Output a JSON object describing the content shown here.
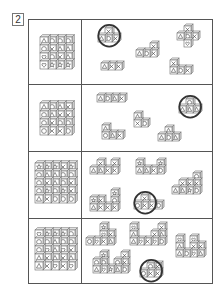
{
  "question": {
    "number": "2"
  },
  "colors": {
    "line": "#555555",
    "cube_stroke": "#666666",
    "cube_top": "#e8e8e8",
    "cube_side": "#d0d0d0",
    "circle": "#333333"
  },
  "symbols_legend": {
    "o": "circle",
    "x": "cross",
    "t": "triangle",
    "h": "heart",
    "s": "star"
  },
  "rows": [
    {
      "id": 1,
      "block": {
        "x": 40,
        "y": 37,
        "cell": 8,
        "grid": [
          [
            "t",
            "o",
            "o",
            "o"
          ],
          [
            "o",
            "x",
            "t",
            "t"
          ],
          [
            "h",
            "o",
            "x",
            "t"
          ],
          [
            "h",
            "s",
            "s",
            "s"
          ]
        ]
      },
      "pieces": [
        {
          "circled": true,
          "cells": [
            {
              "c": 1,
              "r": 0,
              "s": "x"
            },
            {
              "c": 0,
              "r": 1,
              "s": "t"
            },
            {
              "c": 1,
              "r": 1,
              "s": "o"
            },
            {
              "c": 2,
              "r": 1,
              "s": "x"
            }
          ],
          "x": 98,
          "y": 28,
          "cell": 7
        },
        {
          "circled": false,
          "cells": [
            {
              "c": 2,
              "r": 0,
              "s": "x"
            },
            {
              "c": 0,
              "r": 1,
              "s": "t"
            },
            {
              "c": 1,
              "r": 1,
              "s": "o"
            },
            {
              "c": 2,
              "r": 1,
              "s": "x"
            }
          ],
          "x": 136,
          "y": 43,
          "cell": 7
        },
        {
          "circled": false,
          "cells": [
            {
              "c": 1,
              "r": 0,
              "s": "x"
            },
            {
              "c": 0,
              "r": 1,
              "s": "t"
            },
            {
              "c": 1,
              "r": 1,
              "s": "o"
            },
            {
              "c": 2,
              "r": 1,
              "s": "x"
            },
            {
              "c": 1,
              "r": 2,
              "s": "h"
            }
          ],
          "x": 177,
          "y": 26,
          "cell": 7
        },
        {
          "circled": false,
          "cells": [
            {
              "c": 0,
              "r": 0,
              "s": "t"
            },
            {
              "c": 1,
              "r": 0,
              "s": "x"
            },
            {
              "c": 2,
              "r": 0,
              "s": "x"
            }
          ],
          "x": 101,
          "y": 63,
          "cell": 7
        },
        {
          "circled": false,
          "cells": [
            {
              "c": 0,
              "r": 0,
              "s": "x"
            },
            {
              "c": 0,
              "r": 1,
              "s": "t"
            },
            {
              "c": 1,
              "r": 1,
              "s": "o"
            },
            {
              "c": 2,
              "r": 1,
              "s": "x"
            }
          ],
          "x": 170,
          "y": 60,
          "cell": 7
        }
      ]
    },
    {
      "id": 2,
      "block": {
        "x": 40,
        "y": 103,
        "cell": 8,
        "grid": [
          [
            "t",
            "o",
            "t",
            "x"
          ],
          [
            "o",
            "t",
            "x",
            "x"
          ],
          [
            "o",
            "x",
            "o",
            "o"
          ],
          [
            "o",
            "x",
            "x",
            "o"
          ]
        ]
      },
      "pieces": [
        {
          "circled": false,
          "cells": [
            {
              "c": 0,
              "r": 0,
              "s": "t"
            },
            {
              "c": 1,
              "r": 0,
              "s": "o"
            },
            {
              "c": 2,
              "r": 0,
              "s": "t"
            },
            {
              "c": 3,
              "r": 0,
              "s": "x"
            }
          ],
          "x": 97,
          "y": 95,
          "cell": 7
        },
        {
          "circled": true,
          "cells": [
            {
              "c": 1,
              "r": 0,
              "s": "o"
            },
            {
              "c": 0,
              "r": 1,
              "s": "t"
            },
            {
              "c": 1,
              "r": 1,
              "s": "t"
            },
            {
              "c": 2,
              "r": 1,
              "s": "t"
            }
          ],
          "x": 179,
          "y": 99,
          "cell": 7
        },
        {
          "circled": false,
          "cells": [
            {
              "c": 0,
              "r": 0,
              "s": "t"
            },
            {
              "c": 0,
              "r": 1,
              "s": "x"
            },
            {
              "c": 1,
              "r": 1,
              "s": "o"
            }
          ],
          "x": 134,
          "y": 113,
          "cell": 7
        },
        {
          "circled": false,
          "cells": [
            {
              "c": 0,
              "r": 0,
              "s": "t"
            },
            {
              "c": 0,
              "r": 1,
              "s": "o"
            },
            {
              "c": 1,
              "r": 1,
              "s": "t"
            },
            {
              "c": 2,
              "r": 1,
              "s": "x"
            }
          ],
          "x": 102,
          "y": 125,
          "cell": 7
        },
        {
          "circled": false,
          "cells": [
            {
              "c": 1,
              "r": 0,
              "s": "t"
            },
            {
              "c": 0,
              "r": 1,
              "s": "t"
            },
            {
              "c": 1,
              "r": 1,
              "s": "o"
            },
            {
              "c": 2,
              "r": 1,
              "s": "t"
            }
          ],
          "x": 158,
          "y": 127,
          "cell": 7
        }
      ]
    },
    {
      "id": 3,
      "block": {
        "x": 35,
        "y": 163,
        "cell": 8,
        "grid": [
          [
            "s",
            "s",
            "s",
            "x",
            "s"
          ],
          [
            "o",
            "t",
            "t",
            "o",
            "o"
          ],
          [
            "o",
            "x",
            "t",
            "o",
            "x"
          ],
          [
            "o",
            "s",
            "o",
            "s",
            "x"
          ],
          [
            "t",
            "x",
            "o",
            "o",
            "o"
          ]
        ]
      },
      "pieces": [
        {
          "circled": false,
          "cells": [
            {
              "c": 1,
              "r": 0,
              "s": "x"
            },
            {
              "c": 3,
              "r": 0,
              "s": "x"
            },
            {
              "c": 0,
              "r": 1,
              "s": "t"
            },
            {
              "c": 1,
              "r": 1,
              "s": "t"
            },
            {
              "c": 2,
              "r": 1,
              "s": "x"
            },
            {
              "c": 3,
              "r": 1,
              "s": "x"
            }
          ],
          "x": 90,
          "y": 160,
          "cell": 7
        },
        {
          "circled": false,
          "cells": [
            {
              "c": 0,
              "r": 0,
              "s": "s"
            },
            {
              "c": 3,
              "r": 0,
              "s": "s"
            },
            {
              "c": 0,
              "r": 1,
              "s": "t"
            },
            {
              "c": 1,
              "r": 1,
              "s": "t"
            },
            {
              "c": 2,
              "r": 1,
              "s": "x"
            },
            {
              "c": 3,
              "r": 1,
              "s": "o"
            }
          ],
          "x": 136,
          "y": 160,
          "cell": 7
        },
        {
          "circled": false,
          "cells": [
            {
              "c": 3,
              "r": 0,
              "s": "o"
            },
            {
              "c": 1,
              "r": 1,
              "s": "x"
            },
            {
              "c": 2,
              "r": 1,
              "s": "x"
            },
            {
              "c": 3,
              "r": 1,
              "s": "x"
            },
            {
              "c": 0,
              "r": 2,
              "s": "t"
            },
            {
              "c": 1,
              "r": 2,
              "s": "t"
            },
            {
              "c": 2,
              "r": 2,
              "s": "s"
            },
            {
              "c": 3,
              "r": 2,
              "s": "o"
            }
          ],
          "x": 172,
          "y": 173,
          "cell": 7
        },
        {
          "circled": false,
          "cells": [
            {
              "c": 3,
              "r": 0,
              "s": "s"
            },
            {
              "c": 0,
              "r": 1,
              "s": "s"
            },
            {
              "c": 1,
              "r": 1,
              "s": "x"
            },
            {
              "c": 3,
              "r": 1,
              "s": "o"
            },
            {
              "c": 0,
              "r": 2,
              "s": "t"
            },
            {
              "c": 1,
              "r": 2,
              "s": "x"
            },
            {
              "c": 2,
              "r": 2,
              "s": "x"
            },
            {
              "c": 3,
              "r": 2,
              "s": "x"
            }
          ],
          "x": 90,
          "y": 190,
          "cell": 7
        },
        {
          "circled": true,
          "cells": [
            {
              "c": 1,
              "r": 0,
              "s": "x"
            },
            {
              "c": 0,
              "r": 1,
              "s": "o"
            },
            {
              "c": 1,
              "r": 1,
              "s": "x"
            },
            {
              "c": 2,
              "r": 1,
              "s": "x"
            },
            {
              "c": 3,
              "r": 1,
              "s": "o"
            }
          ],
          "x": 134,
          "y": 195,
          "cell": 7
        }
      ]
    },
    {
      "id": 4,
      "block": {
        "x": 35,
        "y": 230,
        "cell": 8,
        "grid": [
          [
            "h",
            "s",
            "s",
            "s",
            "o"
          ],
          [
            "o",
            "o",
            "t",
            "o",
            "o"
          ],
          [
            "o",
            "h",
            "t",
            "h",
            "x"
          ],
          [
            "t",
            "x",
            "t",
            "x",
            "t"
          ],
          [
            "t",
            "x",
            "h",
            "x",
            "h"
          ]
        ]
      },
      "pieces": [
        {
          "circled": false,
          "cells": [
            {
              "c": 2,
              "r": 0,
              "s": "s"
            },
            {
              "c": 2,
              "r": 1,
              "s": "h"
            },
            {
              "c": 3,
              "r": 1,
              "s": "x"
            },
            {
              "c": 0,
              "r": 2,
              "s": "o"
            },
            {
              "c": 1,
              "r": 2,
              "s": "h"
            },
            {
              "c": 2,
              "r": 2,
              "s": "x"
            },
            {
              "c": 3,
              "r": 2,
              "s": "t"
            }
          ],
          "x": 86,
          "y": 224,
          "cell": 7
        },
        {
          "circled": false,
          "cells": [
            {
              "c": 0,
              "r": 0,
              "s": "h"
            },
            {
              "c": 4,
              "r": 0,
              "s": "x"
            },
            {
              "c": 0,
              "r": 1,
              "s": "t"
            },
            {
              "c": 3,
              "r": 1,
              "s": "x"
            },
            {
              "c": 4,
              "r": 1,
              "s": "t"
            },
            {
              "c": 0,
              "r": 2,
              "s": "t"
            },
            {
              "c": 1,
              "r": 2,
              "s": "h"
            },
            {
              "c": 2,
              "r": 2,
              "s": "x"
            },
            {
              "c": 3,
              "r": 2,
              "s": "h"
            },
            {
              "c": 4,
              "r": 2,
              "s": "o"
            }
          ],
          "x": 130,
          "y": 224,
          "cell": 7
        },
        {
          "circled": false,
          "cells": [
            {
              "c": 0,
              "r": 0,
              "s": "h"
            },
            {
              "c": 2,
              "r": 0,
              "s": "h"
            },
            {
              "c": 0,
              "r": 1,
              "s": "t"
            },
            {
              "c": 2,
              "r": 1,
              "s": "x"
            },
            {
              "c": 3,
              "r": 1,
              "s": "x"
            },
            {
              "c": 0,
              "r": 2,
              "s": "t"
            },
            {
              "c": 1,
              "r": 2,
              "s": "o"
            },
            {
              "c": 2,
              "r": 2,
              "s": "h"
            },
            {
              "c": 3,
              "r": 2,
              "s": "t"
            }
          ],
          "x": 176,
          "y": 236,
          "cell": 7
        },
        {
          "circled": false,
          "cells": [
            {
              "c": 1,
              "r": 0,
              "s": "s"
            },
            {
              "c": 4,
              "r": 0,
              "s": "x"
            },
            {
              "c": 0,
              "r": 1,
              "s": "o"
            },
            {
              "c": 1,
              "r": 1,
              "s": "o"
            },
            {
              "c": 3,
              "r": 1,
              "s": "o"
            },
            {
              "c": 4,
              "r": 1,
              "s": "x"
            },
            {
              "c": 0,
              "r": 2,
              "s": "t"
            },
            {
              "c": 1,
              "r": 2,
              "s": "h"
            },
            {
              "c": 2,
              "r": 2,
              "s": "s"
            },
            {
              "c": 3,
              "r": 2,
              "s": "t"
            },
            {
              "c": 4,
              "r": 2,
              "s": "o"
            }
          ],
          "x": 93,
          "y": 252,
          "cell": 7
        },
        {
          "circled": true,
          "cells": [
            {
              "c": 1,
              "r": 0,
              "s": "o"
            },
            {
              "c": 2,
              "r": 0,
              "s": "x"
            },
            {
              "c": 0,
              "r": 1,
              "s": "o"
            },
            {
              "c": 1,
              "r": 1,
              "s": "x"
            },
            {
              "c": 2,
              "r": 1,
              "s": "x"
            }
          ],
          "x": 140,
          "y": 263,
          "cell": 7
        }
      ]
    }
  ],
  "row_dividers_y": [
    84,
    151,
    218
  ]
}
